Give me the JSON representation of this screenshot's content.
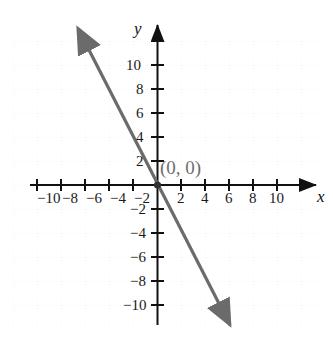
{
  "figure": {
    "background_color": "#ffffff",
    "width": 333,
    "height": 339
  },
  "chart_data": {
    "type": "line",
    "title": "",
    "xlabel": "x",
    "ylabel": "y",
    "xlim": [
      -11.5,
      13
    ],
    "ylim": [
      -13,
      12.5
    ],
    "grid": "dotted light grid every 2 units",
    "legend": "none",
    "x_ticks": [
      -10,
      -8,
      -6,
      -4,
      -2,
      2,
      4,
      6,
      8,
      10
    ],
    "y_ticks": [
      10,
      8,
      6,
      4,
      2,
      -2,
      -4,
      -6,
      -8,
      -10
    ],
    "x_tick_labels": [
      "−10",
      "−8",
      "−6",
      "−4",
      "−2",
      "2",
      "4",
      "6",
      "8",
      "10"
    ],
    "y_tick_labels": [
      "10",
      "8",
      "6",
      "4",
      "2",
      "−2",
      "−4",
      "−6",
      "−8",
      "−10"
    ],
    "series": [
      {
        "name": "y = -2x",
        "slope": -2,
        "intercept": 0,
        "color": "#6b6b6b",
        "arrows": "both ends",
        "x": [
          -5.75,
          6.1
        ],
        "y": [
          11.5,
          -12.2
        ]
      }
    ],
    "annotations": [
      {
        "text": "(0, 0)",
        "x": 0,
        "y": 0,
        "color": "#6e6e6e",
        "label_offset": "up-right"
      }
    ],
    "points": [
      {
        "x": 0,
        "y": 0,
        "marker": "dot",
        "color": "#333333"
      }
    ]
  },
  "axes": {
    "x_axis_name": "x",
    "y_axis_name": "y",
    "axis_color": "#111111",
    "origin_px": {
      "x": 157,
      "y": 185
    },
    "unit_px": 12
  },
  "annotation": {
    "origin_point_label": "(0, 0)"
  },
  "x_tick_labels": [
    {
      "text": "−10",
      "px": 37,
      "py": 191
    },
    {
      "text": "−8",
      "px": 62,
      "py": 191
    },
    {
      "text": "−6",
      "px": 86,
      "py": 191
    },
    {
      "text": "−4",
      "px": 110,
      "py": 191
    },
    {
      "text": "−2",
      "px": 134,
      "py": 191
    },
    {
      "text": "2",
      "px": 177,
      "py": 191
    },
    {
      "text": "4",
      "px": 201,
      "py": 191
    },
    {
      "text": "6",
      "px": 225,
      "py": 191
    },
    {
      "text": "8",
      "px": 249,
      "py": 191
    },
    {
      "text": "10",
      "px": 269,
      "py": 191
    }
  ],
  "y_tick_labels": [
    {
      "text": "10",
      "px": 126,
      "py": 58
    },
    {
      "text": "8",
      "px": 136,
      "py": 82
    },
    {
      "text": "6",
      "px": 136,
      "py": 106
    },
    {
      "text": "4",
      "px": 136,
      "py": 130
    },
    {
      "text": "2",
      "px": 136,
      "py": 154
    },
    {
      "text": "−2",
      "px": 130,
      "py": 202
    },
    {
      "text": "−4",
      "px": 130,
      "py": 226
    },
    {
      "text": "−6",
      "px": 130,
      "py": 250
    },
    {
      "text": "−8",
      "px": 130,
      "py": 274
    },
    {
      "text": "−10",
      "px": 123,
      "py": 298
    }
  ]
}
